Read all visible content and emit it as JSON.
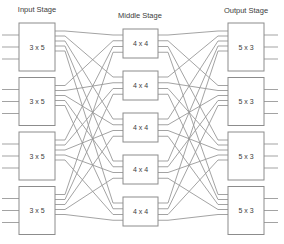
{
  "diagram": {
    "type": "clos_network",
    "title_labels": {
      "input": "Input Stage",
      "middle": "Middle Stage",
      "output": "Output Stage"
    },
    "stages": {
      "input": {
        "count": 4,
        "box_label": "3 x 5",
        "external_lines_per_box": 3,
        "ports_to_next": 5
      },
      "middle": {
        "count": 5,
        "box_label": "4 x 4",
        "ports_from_prev": 4,
        "ports_to_next": 4
      },
      "output": {
        "count": 4,
        "box_label": "5 x 3",
        "ports_from_prev": 5,
        "external_lines_per_box": 3
      }
    },
    "connections": {
      "input_to_middle": "full",
      "middle_to_output": "full"
    },
    "colors": {
      "background": "#ffffff",
      "box_border": "#8c8c8c",
      "box_fill": "#ffffff",
      "line": "#999999",
      "text": "#3d3d3d"
    }
  }
}
